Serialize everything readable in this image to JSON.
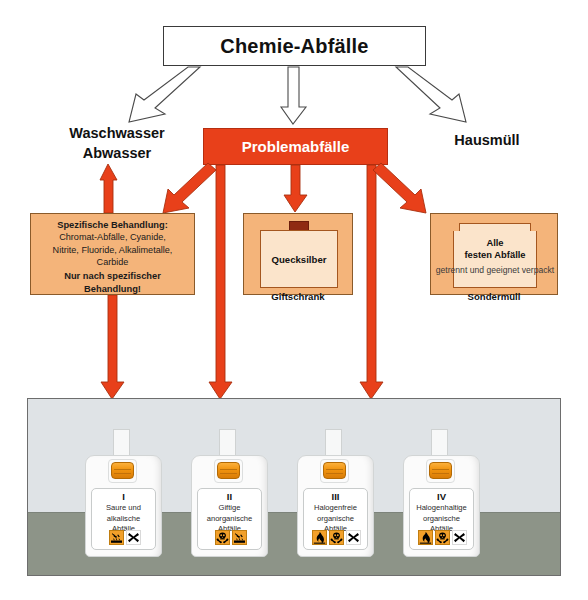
{
  "colors": {
    "red": "#e8401a",
    "orange_box": "#f4b47a",
    "orange_inner": "#fbe4cb",
    "picto_orange": "#f2a02a",
    "panel_bg": "#dfe3e6",
    "panel_floor": "#8d9488",
    "border_dark": "#3a3a3a"
  },
  "header": {
    "title": "Chemie-Abfälle"
  },
  "branches": {
    "left_label_line1": "Waschwasser",
    "left_label_line2": "Abwasser",
    "center_label": "Problemabfälle",
    "right_label": "Hausmüll"
  },
  "boxes": {
    "specific": {
      "heading": "Spezifische Behandlung:",
      "items_line1": "Chromat-Abfälle, Cyanide,",
      "items_line2": "Nitrite, Fluoride, Alkalimetalle,",
      "items_line3": "Carbide",
      "footer_line1": "Nur nach spezifischer",
      "footer_line2": "Behandlung!"
    },
    "cabinet": {
      "content_label": "Quecksilber",
      "caption": "Giftschrank"
    },
    "drum": {
      "title_line1": "Alle",
      "title_line2": "festen Abfälle",
      "subtitle": "getrennt und geeignet verpackt",
      "caption": "Sondermüll"
    }
  },
  "canisters": [
    {
      "roman": "I",
      "text_line1": "Saure und",
      "text_line2": "alkalische",
      "text_line3": "Abfälle",
      "pictograms": [
        "corrosive-icon",
        "harmful-x-icon"
      ]
    },
    {
      "roman": "II",
      "text_line1": "Giftige",
      "text_line2": "anorganische",
      "text_line3": "Abfälle",
      "pictograms": [
        "toxic-skull-icon",
        "corrosive-icon"
      ]
    },
    {
      "roman": "III",
      "text_line1": "Halogenfreie",
      "text_line2": "organische",
      "text_line3": "Abfälle",
      "pictograms": [
        "flammable-icon",
        "toxic-skull-icon",
        "harmful-x-icon"
      ]
    },
    {
      "roman": "IV",
      "text_line1": "Halogenhaltige",
      "text_line2": "organische",
      "text_line3": "Abfälle",
      "pictograms": [
        "flammable-icon",
        "toxic-skull-icon",
        "harmful-x-icon"
      ]
    }
  ]
}
